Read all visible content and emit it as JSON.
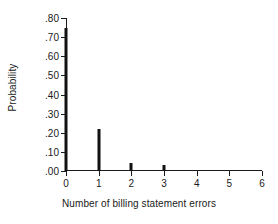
{
  "chart_data": {
    "type": "bar",
    "title": "",
    "xlabel": "Number of billing statement errors",
    "ylabel": "Probability",
    "categories": [
      "0",
      "1",
      "2",
      "3",
      "4",
      "5",
      "6"
    ],
    "x": [
      0,
      1,
      2,
      3,
      4,
      5,
      6
    ],
    "values": [
      0.75,
      0.22,
      0.04,
      0.03,
      0.0,
      0.0,
      0.0
    ],
    "xlim": [
      0,
      6
    ],
    "ylim": [
      0.0,
      0.8
    ],
    "xticks": [
      0,
      1,
      2,
      3,
      4,
      5,
      6
    ],
    "xticklabels": [
      "0",
      "1",
      "2",
      "3",
      "4",
      "5",
      "6"
    ],
    "yticks": [
      0.0,
      0.1,
      0.2,
      0.3,
      0.4,
      0.5,
      0.6,
      0.7,
      0.8
    ],
    "yticklabels": [
      ".00",
      ".10",
      ".20",
      ".30",
      ".40",
      ".50",
      ".60",
      ".70",
      ".80"
    ],
    "grid": false,
    "legend": false,
    "bar_color": "#111111",
    "axis_color": "#1a1a1a"
  }
}
